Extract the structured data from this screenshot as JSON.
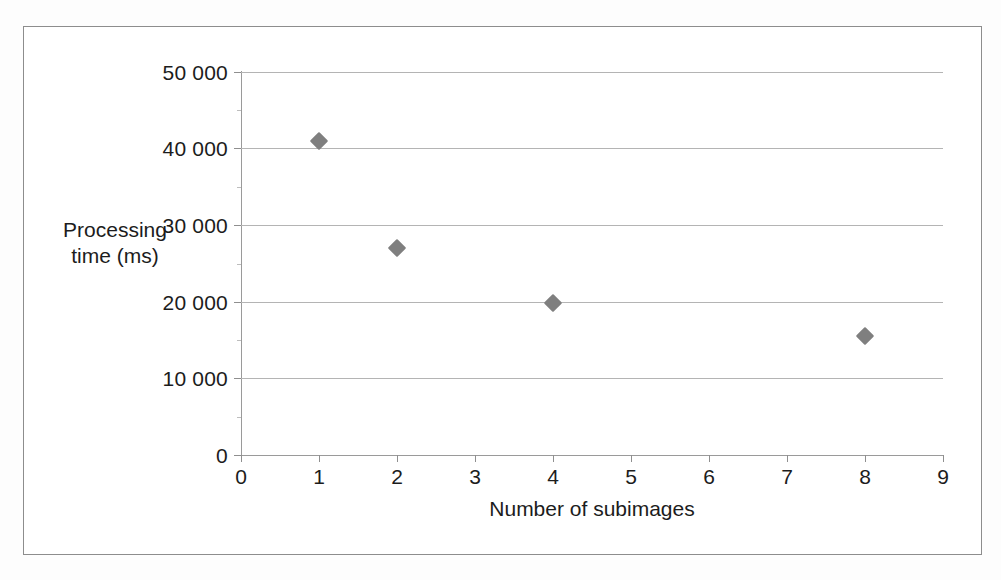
{
  "figure": {
    "background_color": "#ffffff",
    "frame_color": "#8d8d8d"
  },
  "chart_data": {
    "type": "scatter",
    "title": "",
    "subtitle": "",
    "xlabel": "Number of subimages",
    "ylabel_lines": [
      "Processing",
      "time (ms)"
    ],
    "ylabel": "Processing time (ms)",
    "x": [
      1,
      2,
      4,
      8
    ],
    "values": [
      41000,
      27000,
      19800,
      15500
    ],
    "points": [
      {
        "x": 1,
        "y": 41000
      },
      {
        "x": 2,
        "y": 27000
      },
      {
        "x": 4,
        "y": 19800
      },
      {
        "x": 8,
        "y": 15500
      }
    ],
    "xlim": [
      0,
      9
    ],
    "ylim": [
      0,
      50000
    ],
    "xticks": [
      0,
      1,
      2,
      3,
      4,
      5,
      6,
      7,
      8,
      9
    ],
    "xticklabels": [
      "0",
      "1",
      "2",
      "3",
      "4",
      "5",
      "6",
      "7",
      "8",
      "9"
    ],
    "yticks": [
      0,
      10000,
      20000,
      30000,
      40000,
      50000
    ],
    "yticklabels": [
      "0",
      "10 000",
      "20 000",
      "30 000",
      "40 000",
      "50 000"
    ],
    "grid": {
      "horizontal": true,
      "vertical": false
    },
    "legend": null,
    "marker": {
      "shape": "diamond",
      "color": "#7f7f7f",
      "size": 13
    },
    "annotations": []
  },
  "axis": {
    "x_title": "Number of subimages",
    "y_title_line1": "Processing",
    "y_title_line2": "time (ms)",
    "y_labels": {
      "t0": "0",
      "t1": "10 000",
      "t2": "20 000",
      "t3": "30 000",
      "t4": "40 000",
      "t5": "50 000"
    },
    "x_labels": {
      "t0": "0",
      "t1": "1",
      "t2": "2",
      "t3": "3",
      "t4": "4",
      "t5": "5",
      "t6": "6",
      "t7": "7",
      "t8": "8",
      "t9": "9"
    }
  }
}
